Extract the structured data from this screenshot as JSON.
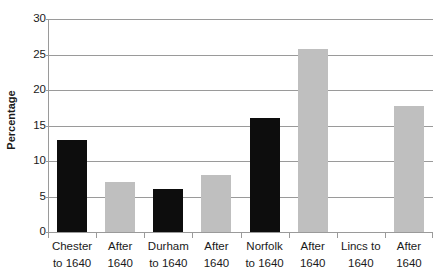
{
  "chart_data": {
    "type": "bar",
    "title": "",
    "xlabel": "",
    "ylabel": "Percentage",
    "ylim": [
      0,
      30
    ],
    "yticks": [
      0,
      5,
      10,
      15,
      20,
      25,
      30
    ],
    "ytick_labels": [
      "0",
      "5",
      "10",
      "15",
      "20",
      "25",
      "30"
    ],
    "grid": true,
    "legend": "none",
    "categories": [
      "Chester to 1640",
      "After 1640",
      "Durham to 1640",
      "After 1640",
      "Norfolk to 1640",
      "After 1640",
      "Lincs to 1640",
      "After 1640"
    ],
    "category_lines": [
      [
        "Chester",
        "to 1640"
      ],
      [
        "After",
        "1640"
      ],
      [
        "Durham",
        "to 1640"
      ],
      [
        "After",
        "1640"
      ],
      [
        "Norfolk",
        "to 1640"
      ],
      [
        "After",
        "1640"
      ],
      [
        "Lincs to",
        "1640"
      ],
      [
        "After",
        "1640"
      ]
    ],
    "values": [
      13,
      7,
      6,
      8,
      16,
      25.8,
      0,
      17.8
    ],
    "bar_series": [
      "black",
      "gray",
      "black",
      "gray",
      "black",
      "gray",
      "black",
      "gray"
    ],
    "colors": {
      "series_black": "#0d0d0d",
      "series_gray": "#bfbfbf",
      "gridline": "#9a9a9a",
      "axis": "#9a9a9a",
      "text": "#1a1a1a",
      "background": "#ffffff"
    }
  }
}
